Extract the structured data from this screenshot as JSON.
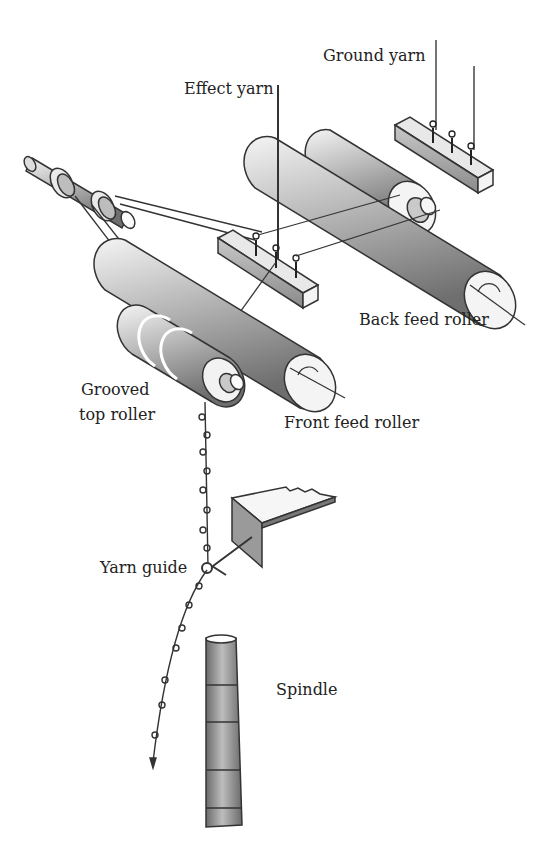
{
  "diagram": {
    "type": "technical illustration",
    "labels": {
      "ground_yarn": "Ground yarn",
      "effect_yarn": "Effect yarn",
      "back_feed_roller": "Back feed roller",
      "grooved_top_roller_line1": "Grooved",
      "grooved_top_roller_line2": "top roller",
      "front_feed_roller": "Front feed roller",
      "yarn_guide": "Yarn guide",
      "spindle": "Spindle"
    },
    "components": [
      "ground-yarn-guide-bar",
      "effect-yarn-guide-bar",
      "back-feed-roller-pair",
      "front-feed-roller",
      "grooved-top-roller",
      "drive-shaft-with-pulleys",
      "yarn-guide",
      "spindle"
    ],
    "colors": {
      "background": "#ffffff",
      "stroke": "#333333",
      "roller_light": "#f2f2f2",
      "roller_dark": "#7a7a7a",
      "text": "#222222"
    }
  }
}
